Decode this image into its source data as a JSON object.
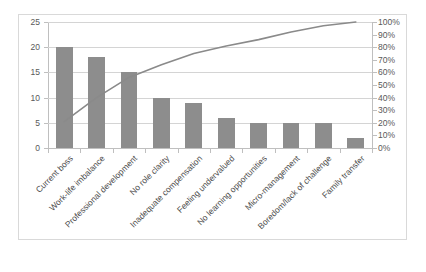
{
  "chart_data": {
    "type": "bar",
    "title": "",
    "subtitle": "",
    "xlabel": "",
    "ylabel": "",
    "categories": [
      "Current boss",
      "Work-life imbalance",
      "Professional development",
      "No role clarity",
      "Inadequate compensation",
      "Feeling undervalued",
      "No learning opportunities",
      "Micro-management",
      "Boredom/lack of challenge",
      "Family transfer"
    ],
    "series": [
      {
        "name": "Count",
        "type": "bar",
        "axis": "left",
        "values": [
          20,
          18,
          15,
          10,
          9,
          6,
          5,
          5,
          5,
          2
        ],
        "color": "#8d8d8d"
      },
      {
        "name": "Cumulative %",
        "type": "line",
        "axis": "right",
        "values": [
          21,
          40,
          56,
          66,
          75,
          81,
          86,
          92,
          97,
          100
        ],
        "color": "#8a8a8a"
      }
    ],
    "total": 95,
    "ylim": [
      0,
      25
    ],
    "y2lim": [
      0,
      100
    ],
    "yticks": [
      "0",
      "5",
      "10",
      "15",
      "20",
      "25"
    ],
    "ytick_values": [
      0,
      5,
      10,
      15,
      20,
      25
    ],
    "y2ticks": [
      "0%",
      "10%",
      "20%",
      "30%",
      "40%",
      "50%",
      "60%",
      "70%",
      "80%",
      "90%",
      "100%"
    ],
    "y2tick_values": [
      0,
      10,
      20,
      30,
      40,
      50,
      60,
      70,
      80,
      90,
      100
    ],
    "grid": true,
    "legend": "none",
    "plot_background": "#ffffff",
    "gridline_color": "#d4d4d4",
    "border_color": "#d9d9d9",
    "axis_text_color": "#595959"
  }
}
